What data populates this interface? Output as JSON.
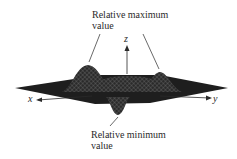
{
  "labels": {
    "max_line1": "Relative maximum",
    "max_line2": "value",
    "min_line1": "Relative minimum",
    "min_line2": "value"
  },
  "axes": {
    "x": "x",
    "y": "y",
    "z": "z"
  },
  "colors": {
    "surface": "#1e1e1e",
    "mesh": "#6a6a6a",
    "text": "#2a2a2a"
  }
}
